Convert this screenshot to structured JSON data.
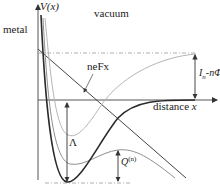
{
  "diagram": {
    "regions": {
      "left": "metal",
      "right": "vacuum"
    },
    "axes": {
      "y_label": "V(x)",
      "x_label": "distance",
      "x_symbol": "x"
    },
    "annotations": {
      "field_line": "neFx",
      "ionization_gap": "I",
      "ionization_gap_sub": "n",
      "ionization_gap_rest": "-nΦ",
      "lambda": "Λ",
      "q_label": "Q",
      "q_sup": "(n)"
    },
    "curves": [
      {
        "name": "total-potential",
        "color": "#2a2a2a",
        "style": "solid-thick"
      },
      {
        "name": "upper-potential",
        "color": "#b0b0b0",
        "style": "solid"
      },
      {
        "name": "field-modified-potential",
        "color": "#8f8f8f",
        "style": "solid"
      },
      {
        "name": "field-line",
        "color": "#444444",
        "style": "solid"
      }
    ],
    "colors": {
      "axis": "#555555",
      "dark_curve": "#2a2a2a",
      "light_curve": "#b0b0b0",
      "mid_curve": "#8f8f8f",
      "dashed": "#9a9a9a"
    }
  }
}
